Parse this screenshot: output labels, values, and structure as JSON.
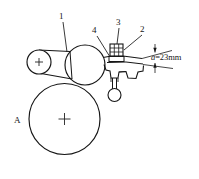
{
  "figure": {
    "type": "mechanical-line-drawing",
    "background_color": "#ffffff",
    "line_color": "#161616"
  },
  "callouts": [
    {
      "id": "callout-1",
      "label": "1",
      "x": 61,
      "y": 16,
      "target": "cylindrical-roller"
    },
    {
      "id": "callout-2",
      "label": "2",
      "x": 142,
      "y": 29,
      "target": "plate-bracket"
    },
    {
      "id": "callout-3",
      "label": "3",
      "x": 118,
      "y": 22,
      "target": "hatched-block"
    },
    {
      "id": "callout-4",
      "label": "4",
      "x": 94,
      "y": 30,
      "target": "drum-mount"
    }
  ],
  "part_labels": [
    {
      "id": "part-A",
      "label": "A",
      "x": 16,
      "y": 120,
      "target": "large-drum"
    }
  ],
  "dimensions": [
    {
      "id": "clearance-dimension",
      "symbol": "a",
      "equals": "=",
      "value": "23",
      "unit": "mm",
      "text": "a=23mm",
      "x": 152,
      "y": 58
    }
  ],
  "shapes": {
    "large_drum": {
      "cx": 64.5,
      "cy": 119,
      "r": 35.5,
      "center_mark": true
    },
    "middle_drum": {
      "cx": 85,
      "cy": 65,
      "r": 20,
      "center_mark": false
    },
    "small_roller": {
      "cx": 39,
      "cy": 62,
      "r": 12,
      "center_mark": true
    },
    "pendulum_ball": {
      "cx": 114,
      "cy": 95,
      "r": 6.5
    },
    "hatched_block": {
      "x": 110,
      "y": 44,
      "w": 13,
      "h": 12,
      "hatch": true
    }
  }
}
